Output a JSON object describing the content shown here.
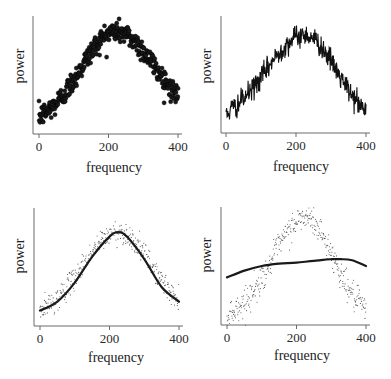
{
  "figure": {
    "panels": [
      {
        "id": "top-left",
        "xlabel": "frequency",
        "ylabel": "power",
        "xticks": [
          "0",
          "200",
          "400"
        ],
        "description": "dense scatter of noisy power spectrum (large dots)"
      },
      {
        "id": "top-right",
        "xlabel": "frequency",
        "ylabel": "power",
        "xticks": [
          "0",
          "200",
          "400"
        ],
        "description": "noisy power spectrum drawn as a jagged line"
      },
      {
        "id": "bottom-left",
        "xlabel": "frequency",
        "ylabel": "power",
        "xticks": [
          "0",
          "200",
          "400"
        ],
        "description": "small-dot scatter with a good smooth fit (Gaussian-like bump)"
      },
      {
        "id": "bottom-right",
        "xlabel": "frequency",
        "ylabel": "power",
        "xticks": [
          "0",
          "200",
          "400"
        ],
        "description": "small-dot scatter with a poor, over-smoothed nearly flat fit"
      }
    ]
  },
  "chart_data": [
    {
      "type": "scatter",
      "title": "",
      "xlabel": "frequency",
      "ylabel": "power",
      "xlim": [
        0,
        400
      ],
      "xticks": [
        0,
        200,
        400
      ],
      "yticks": [],
      "grid": false,
      "legend": null,
      "marker": "large filled dots",
      "n_points": 400,
      "signal": {
        "shape": "bump",
        "peak_x": 220,
        "baseline_at_0": 0.12,
        "peak": 0.88,
        "value_at_400": 0.3
      },
      "noise_sd": 0.05
    },
    {
      "type": "line",
      "title": "",
      "xlabel": "frequency",
      "ylabel": "power",
      "xlim": [
        0,
        400
      ],
      "xticks": [
        0,
        200,
        400
      ],
      "yticks": [],
      "grid": false,
      "legend": null,
      "n_points": 400,
      "signal": {
        "shape": "bump",
        "peak_x": 225,
        "baseline_at_0": 0.16,
        "peak": 0.85,
        "value_at_400": 0.18
      },
      "noise_sd": 0.05
    },
    {
      "type": "scatter",
      "title": "",
      "xlabel": "frequency",
      "ylabel": "power",
      "xlim": [
        0,
        400
      ],
      "xticks": [
        0,
        200,
        400
      ],
      "yticks": [],
      "grid": false,
      "legend": null,
      "marker": "small dots",
      "n_points": 400,
      "signal": {
        "shape": "bump",
        "peak_x": 225,
        "baseline_at_0": 0.12,
        "peak": 0.82,
        "value_at_400": 0.2
      },
      "noise_sd": 0.05,
      "fit_line": {
        "x": [
          0,
          50,
          100,
          150,
          200,
          225,
          250,
          300,
          350,
          400
        ],
        "y": [
          0.12,
          0.2,
          0.37,
          0.6,
          0.78,
          0.82,
          0.78,
          0.58,
          0.33,
          0.2
        ]
      }
    },
    {
      "type": "scatter",
      "title": "",
      "xlabel": "frequency",
      "ylabel": "power",
      "xlim": [
        0,
        400
      ],
      "xticks": [
        0,
        200,
        400
      ],
      "yticks": [],
      "grid": false,
      "legend": null,
      "marker": "small dots",
      "n_points": 400,
      "signal": {
        "shape": "bump",
        "peak_x": 225,
        "baseline_at_0": 0.08,
        "peak": 0.92,
        "value_at_400": 0.12
      },
      "noise_sd": 0.06,
      "fit_line": {
        "x": [
          0,
          50,
          100,
          150,
          200,
          250,
          300,
          330,
          360,
          400
        ],
        "y": [
          0.4,
          0.46,
          0.5,
          0.52,
          0.53,
          0.545,
          0.56,
          0.56,
          0.55,
          0.5
        ]
      }
    }
  ]
}
